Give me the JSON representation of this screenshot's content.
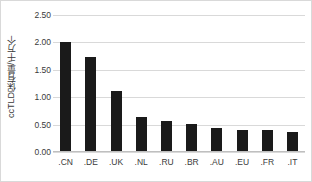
{
  "chart_data": {
    "type": "bar",
    "title": "",
    "xlabel": "",
    "ylabel": "ccTLD保有量/千万个",
    "categories": [
      ".CN",
      ".DE",
      ".UK",
      ".NL",
      ".RU",
      ".BR",
      ".AU",
      ".EU",
      ".FR",
      ".IT"
    ],
    "values": [
      2.01,
      1.74,
      1.11,
      0.63,
      0.57,
      0.51,
      0.43,
      0.41,
      0.41,
      0.37
    ],
    "ylim": [
      0.0,
      2.5
    ],
    "ytick_labels": [
      "0.00",
      "0.50",
      "1.00",
      "1.50",
      "2.00",
      "2.50"
    ],
    "ytick_values": [
      0.0,
      0.5,
      1.0,
      1.5,
      2.0,
      2.5
    ],
    "grid": true,
    "legend": false,
    "bar_color": "#1a1a1a",
    "gridline_color": "#d9d9d9",
    "border_color": "#d9d9d9",
    "background_color": "#ffffff",
    "text_color": "#3a3a3a"
  }
}
